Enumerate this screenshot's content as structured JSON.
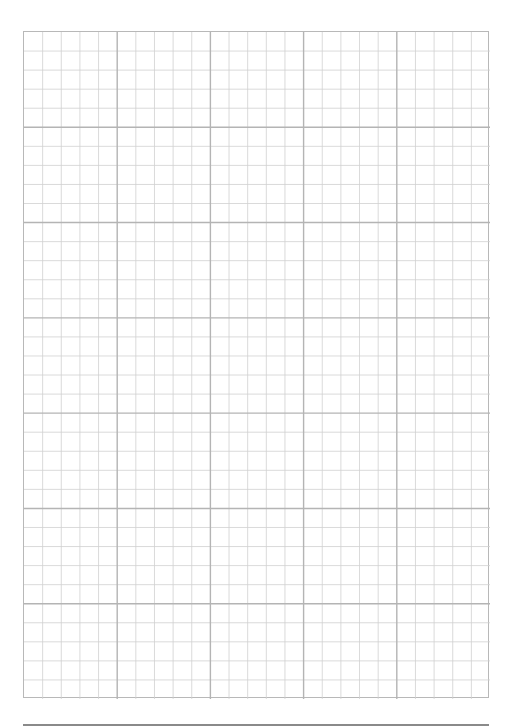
{
  "page": {
    "type": "graph-paper",
    "major_columns": 5,
    "major_rows": 7,
    "minor_per_major": 5,
    "colors": {
      "minor_line": "#d0d0d0",
      "major_line": "#b4b4b4",
      "border": "#b8b8b8",
      "footer_rule": "#8a8a8a",
      "background": "#ffffff"
    }
  }
}
